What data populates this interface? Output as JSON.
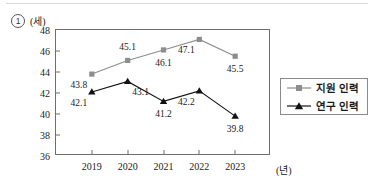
{
  "header": {
    "item_marker": "1",
    "y_unit_label": "(세)"
  },
  "axes": {
    "x_unit_label": "(년)"
  },
  "legend": {
    "entries": [
      {
        "label": "지원 인력",
        "marker": "square-marker-icon",
        "color": "#8d8d8d"
      },
      {
        "label": "연구 인력",
        "marker": "triangle-marker-icon",
        "color": "#111111"
      }
    ]
  },
  "chart_data": {
    "type": "line",
    "title": "",
    "xlabel": "(년)",
    "ylabel": "(세)",
    "categories": [
      "2019",
      "2020",
      "2021",
      "2022",
      "2023"
    ],
    "ylim": [
      36,
      48
    ],
    "yticks": [
      36,
      38,
      40,
      42,
      44,
      46,
      48
    ],
    "grid": false,
    "legend_position": "right",
    "series": [
      {
        "name": "지원 인력",
        "color": "#8d8d8d",
        "marker": "square",
        "values": [
          43.8,
          45.1,
          46.1,
          47.1,
          45.5
        ],
        "labels": [
          "43.8",
          "45.1",
          "46.1",
          "47.1",
          "45.5"
        ],
        "label_positions": [
          "below-left",
          "above",
          "below",
          "below-left",
          "below"
        ]
      },
      {
        "name": "연구 인력",
        "color": "#111111",
        "marker": "triangle",
        "values": [
          42.1,
          43.1,
          41.2,
          42.2,
          39.8
        ],
        "labels": [
          "42.1",
          "43.1",
          "41.2",
          "42.2",
          "39.8"
        ],
        "label_positions": [
          "below-left",
          "below-right",
          "below",
          "below-left",
          "below"
        ]
      }
    ]
  }
}
